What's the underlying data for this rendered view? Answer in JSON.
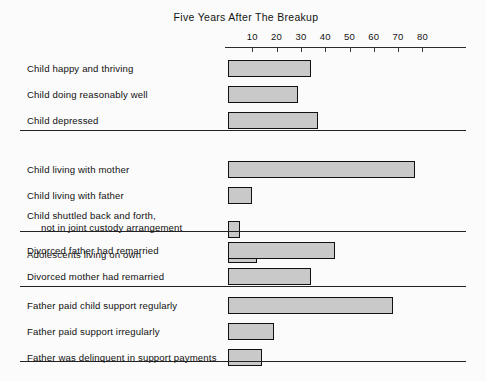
{
  "chart": {
    "title": "Five Years After The Breakup",
    "background_color": "#fbfbfb",
    "bar_fill_color": "#c9c9c9",
    "bar_border_color": "#111111"
  },
  "axis": {
    "ticks": [
      {
        "label": "10",
        "value": 10
      },
      {
        "label": "20",
        "value": 20
      },
      {
        "label": "30",
        "value": 30
      },
      {
        "label": "40",
        "value": 40
      },
      {
        "label": "50",
        "value": 50
      },
      {
        "label": "60",
        "value": 60
      },
      {
        "label": "70",
        "value": 70
      },
      {
        "label": "80",
        "value": 80
      }
    ]
  },
  "groups": [
    {
      "rows": [
        {
          "label": "Child happy and thriving",
          "label2": "",
          "value": 34
        },
        {
          "label": "Child doing reasonably well",
          "label2": "",
          "value": 29
        },
        {
          "label": "Child depressed",
          "label2": "",
          "value": 37
        }
      ]
    },
    {
      "rows": [
        {
          "label": "Child living with mother",
          "label2": "",
          "value": 77
        },
        {
          "label": "Child living with father",
          "label2": "",
          "value": 10
        },
        {
          "label": "Child shuttled back and forth,",
          "label2": "not in joint custody arrangement",
          "value": 5
        },
        {
          "label": "Adolescents living on own",
          "label2": "",
          "value": 12
        }
      ]
    },
    {
      "rows": [
        {
          "label": "Divorced father had remarried",
          "label2": "",
          "value": 44
        },
        {
          "label": "Divorced mother had remarried",
          "label2": "",
          "value": 34
        }
      ]
    },
    {
      "rows": [
        {
          "label": "Father paid child support regularly",
          "label2": "",
          "value": 68
        },
        {
          "label": "Father paid support irregularly",
          "label2": "",
          "value": 19
        },
        {
          "label": "Father was delinquent in support payments",
          "label2": "",
          "value": 14
        }
      ]
    }
  ],
  "chart_data": {
    "type": "bar",
    "orientation": "horizontal",
    "title": "Five Years After The Breakup",
    "xlabel": "",
    "ylabel": "",
    "xlim": [
      0,
      85
    ],
    "xticks": [
      10,
      20,
      30,
      40,
      50,
      60,
      70,
      80
    ],
    "grid": false,
    "legend": "none",
    "categories": [
      "Child happy and thriving",
      "Child doing reasonably well",
      "Child depressed",
      "Child living with mother",
      "Child living with father",
      "Child shuttled back and forth, not in joint custody arrangement",
      "Adolescents living on own",
      "Divorced father had remarried",
      "Divorced mother had remarried",
      "Father paid child support regularly",
      "Father paid support irregularly",
      "Father was delinquent in support payments"
    ],
    "values": [
      34,
      29,
      37,
      77,
      10,
      5,
      12,
      44,
      34,
      68,
      19,
      14
    ],
    "group_separators_after": [
      "Child depressed",
      "Adolescents living on own",
      "Divorced mother had remarried",
      "Father was delinquent in support payments"
    ]
  }
}
